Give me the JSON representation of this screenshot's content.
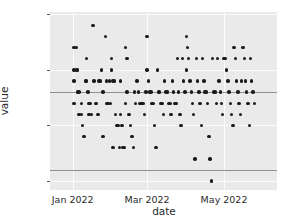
{
  "chart_data": {
    "type": "scatter",
    "title": "",
    "xlabel": "date",
    "ylabel": "value",
    "grid": true,
    "legend": "none",
    "xlim": [
      "2021-12-14",
      "2022-06-12"
    ],
    "ylim": [
      20.42,
      22.02
    ],
    "yticks": [
      22,
      21.5,
      21,
      20.5
    ],
    "ytick_labels": [
      "22",
      "21.5",
      "21",
      "20.5"
    ],
    "xticks": [
      "2022-01-01",
      "2022-03-01",
      "2022-05-01"
    ],
    "xtick_labels": [
      "Jan 2022",
      "Mar 2022",
      "May 2022"
    ],
    "reference_lines": [
      21.3,
      20.6
    ],
    "marker_color": "#1a1a1a",
    "plot_background": "#eaeaea",
    "gridline_color": "#fbfbfb",
    "reference_line_color": "#909090",
    "points": [
      {
        "x": "2022-01-02",
        "y": 21.7
      },
      {
        "x": "2022-01-02",
        "y": 21.5
      },
      {
        "x": "2022-01-02",
        "y": 21.4
      },
      {
        "x": "2022-01-02",
        "y": 21.2
      },
      {
        "x": "2022-01-04",
        "y": 21.7
      },
      {
        "x": "2022-01-04",
        "y": 21.5
      },
      {
        "x": "2022-01-05",
        "y": 21.5
      },
      {
        "x": "2022-01-05",
        "y": 21.3
      },
      {
        "x": "2022-01-06",
        "y": 21.3
      },
      {
        "x": "2022-01-06",
        "y": 21.1
      },
      {
        "x": "2022-01-08",
        "y": 21.2
      },
      {
        "x": "2022-01-08",
        "y": 21.1
      },
      {
        "x": "2022-01-09",
        "y": 21.0
      },
      {
        "x": "2022-01-10",
        "y": 20.9
      },
      {
        "x": "2022-01-11",
        "y": 21.4
      },
      {
        "x": "2022-01-12",
        "y": 21.6
      },
      {
        "x": "2022-01-12",
        "y": 21.4
      },
      {
        "x": "2022-01-13",
        "y": 21.3
      },
      {
        "x": "2022-01-14",
        "y": 21.2
      },
      {
        "x": "2022-01-14",
        "y": 21.1
      },
      {
        "x": "2022-01-15",
        "y": 21.2
      },
      {
        "x": "2022-01-16",
        "y": 21.1
      },
      {
        "x": "2022-01-17",
        "y": 21.9
      },
      {
        "x": "2022-01-18",
        "y": 21.4
      },
      {
        "x": "2022-01-19",
        "y": 21.2
      },
      {
        "x": "2022-01-20",
        "y": 21.2
      },
      {
        "x": "2022-01-21",
        "y": 21.1
      },
      {
        "x": "2022-01-22",
        "y": 21.4
      },
      {
        "x": "2022-01-23",
        "y": 21.4
      },
      {
        "x": "2022-01-24",
        "y": 21.5
      },
      {
        "x": "2022-01-25",
        "y": 21.3
      },
      {
        "x": "2022-01-25",
        "y": 20.9
      },
      {
        "x": "2022-01-27",
        "y": 21.8
      },
      {
        "x": "2022-01-28",
        "y": 21.4
      },
      {
        "x": "2022-01-28",
        "y": 21.2
      },
      {
        "x": "2022-01-29",
        "y": 21.2
      },
      {
        "x": "2022-01-30",
        "y": 21.4
      },
      {
        "x": "2022-01-31",
        "y": 21.2
      },
      {
        "x": "2022-02-01",
        "y": 21.6
      },
      {
        "x": "2022-02-01",
        "y": 21.5
      },
      {
        "x": "2022-02-02",
        "y": 21.4
      },
      {
        "x": "2022-02-02",
        "y": 20.8
      },
      {
        "x": "2022-02-03",
        "y": 21.4
      },
      {
        "x": "2022-02-04",
        "y": 21.1
      },
      {
        "x": "2022-02-05",
        "y": 21.0
      },
      {
        "x": "2022-02-06",
        "y": 21.0
      },
      {
        "x": "2022-02-07",
        "y": 20.8
      },
      {
        "x": "2022-02-08",
        "y": 21.4
      },
      {
        "x": "2022-02-08",
        "y": 21.1
      },
      {
        "x": "2022-02-09",
        "y": 21.0
      },
      {
        "x": "2022-02-10",
        "y": 20.8
      },
      {
        "x": "2022-02-11",
        "y": 20.8
      },
      {
        "x": "2022-02-12",
        "y": 21.7
      },
      {
        "x": "2022-02-12",
        "y": 21.2
      },
      {
        "x": "2022-02-13",
        "y": 21.6
      },
      {
        "x": "2022-02-13",
        "y": 21.3
      },
      {
        "x": "2022-02-14",
        "y": 21.1
      },
      {
        "x": "2022-02-15",
        "y": 21.1
      },
      {
        "x": "2022-02-16",
        "y": 21.0
      },
      {
        "x": "2022-02-17",
        "y": 20.9
      },
      {
        "x": "2022-02-18",
        "y": 20.8
      },
      {
        "x": "2022-02-19",
        "y": 21.3
      },
      {
        "x": "2022-02-20",
        "y": 21.2
      },
      {
        "x": "2022-02-21",
        "y": 21.4
      },
      {
        "x": "2022-02-22",
        "y": 21.3
      },
      {
        "x": "2022-02-23",
        "y": 21.2
      },
      {
        "x": "2022-02-24",
        "y": 21.2
      },
      {
        "x": "2022-02-25",
        "y": 21.2
      },
      {
        "x": "2022-02-26",
        "y": 21.2
      },
      {
        "x": "2022-02-27",
        "y": 21.1
      },
      {
        "x": "2022-02-28",
        "y": 21.3
      },
      {
        "x": "2022-03-01",
        "y": 21.8
      },
      {
        "x": "2022-03-01",
        "y": 21.5
      },
      {
        "x": "2022-03-02",
        "y": 21.4
      },
      {
        "x": "2022-03-03",
        "y": 21.3
      },
      {
        "x": "2022-03-04",
        "y": 21.3
      },
      {
        "x": "2022-03-05",
        "y": 21.2
      },
      {
        "x": "2022-03-06",
        "y": 21.2
      },
      {
        "x": "2022-03-07",
        "y": 21.0
      },
      {
        "x": "2022-03-08",
        "y": 20.8
      },
      {
        "x": "2022-03-09",
        "y": 21.5
      },
      {
        "x": "2022-03-10",
        "y": 21.3
      },
      {
        "x": "2022-03-11",
        "y": 21.3
      },
      {
        "x": "2022-03-12",
        "y": 21.2
      },
      {
        "x": "2022-03-13",
        "y": 21.2
      },
      {
        "x": "2022-03-14",
        "y": 21.1
      },
      {
        "x": "2022-03-15",
        "y": 21.4
      },
      {
        "x": "2022-03-16",
        "y": 21.3
      },
      {
        "x": "2022-03-17",
        "y": 21.3
      },
      {
        "x": "2022-03-18",
        "y": 21.2
      },
      {
        "x": "2022-03-19",
        "y": 21.2
      },
      {
        "x": "2022-03-20",
        "y": 21.1
      },
      {
        "x": "2022-03-21",
        "y": 21.4
      },
      {
        "x": "2022-03-22",
        "y": 21.3
      },
      {
        "x": "2022-03-23",
        "y": 21.2
      },
      {
        "x": "2022-03-24",
        "y": 21.2
      },
      {
        "x": "2022-03-25",
        "y": 21.6
      },
      {
        "x": "2022-03-26",
        "y": 21.3
      },
      {
        "x": "2022-03-27",
        "y": 21.1
      },
      {
        "x": "2022-03-28",
        "y": 21.0
      },
      {
        "x": "2022-03-29",
        "y": 21.6
      },
      {
        "x": "2022-03-30",
        "y": 21.4
      },
      {
        "x": "2022-03-31",
        "y": 21.3
      },
      {
        "x": "2022-04-01",
        "y": 21.8
      },
      {
        "x": "2022-04-01",
        "y": 21.5
      },
      {
        "x": "2022-04-02",
        "y": 21.7
      },
      {
        "x": "2022-04-03",
        "y": 21.6
      },
      {
        "x": "2022-04-04",
        "y": 21.4
      },
      {
        "x": "2022-04-05",
        "y": 21.3
      },
      {
        "x": "2022-04-06",
        "y": 21.2
      },
      {
        "x": "2022-04-07",
        "y": 21.1
      },
      {
        "x": "2022-04-08",
        "y": 20.7
      },
      {
        "x": "2022-04-09",
        "y": 21.6
      },
      {
        "x": "2022-04-10",
        "y": 21.4
      },
      {
        "x": "2022-04-11",
        "y": 21.3
      },
      {
        "x": "2022-04-12",
        "y": 21.2
      },
      {
        "x": "2022-04-13",
        "y": 21.0
      },
      {
        "x": "2022-04-14",
        "y": 21.6
      },
      {
        "x": "2022-04-15",
        "y": 21.4
      },
      {
        "x": "2022-04-16",
        "y": 21.3
      },
      {
        "x": "2022-04-17",
        "y": 21.3
      },
      {
        "x": "2022-04-18",
        "y": 21.2
      },
      {
        "x": "2022-04-19",
        "y": 20.9
      },
      {
        "x": "2022-04-20",
        "y": 20.7
      },
      {
        "x": "2022-04-21",
        "y": 20.5
      },
      {
        "x": "2022-04-22",
        "y": 21.6
      },
      {
        "x": "2022-04-23",
        "y": 21.3
      },
      {
        "x": "2022-04-24",
        "y": 21.3
      },
      {
        "x": "2022-04-25",
        "y": 21.2
      },
      {
        "x": "2022-04-26",
        "y": 21.6
      },
      {
        "x": "2022-04-27",
        "y": 21.4
      },
      {
        "x": "2022-04-28",
        "y": 21.3
      },
      {
        "x": "2022-04-29",
        "y": 21.2
      },
      {
        "x": "2022-04-30",
        "y": 21.1
      },
      {
        "x": "2022-05-01",
        "y": 21.6
      },
      {
        "x": "2022-05-02",
        "y": 21.6
      },
      {
        "x": "2022-05-03",
        "y": 21.5
      },
      {
        "x": "2022-05-04",
        "y": 21.4
      },
      {
        "x": "2022-05-05",
        "y": 21.3
      },
      {
        "x": "2022-05-06",
        "y": 21.2
      },
      {
        "x": "2022-05-07",
        "y": 21.1
      },
      {
        "x": "2022-05-08",
        "y": 21.0
      },
      {
        "x": "2022-05-09",
        "y": 21.7
      },
      {
        "x": "2022-05-10",
        "y": 21.6
      },
      {
        "x": "2022-05-11",
        "y": 21.4
      },
      {
        "x": "2022-05-12",
        "y": 21.3
      },
      {
        "x": "2022-05-13",
        "y": 21.2
      },
      {
        "x": "2022-05-14",
        "y": 21.1
      },
      {
        "x": "2022-05-15",
        "y": 21.4
      },
      {
        "x": "2022-05-16",
        "y": 21.7
      },
      {
        "x": "2022-05-17",
        "y": 21.6
      },
      {
        "x": "2022-05-18",
        "y": 21.4
      },
      {
        "x": "2022-05-19",
        "y": 21.3
      },
      {
        "x": "2022-05-20",
        "y": 21.2
      },
      {
        "x": "2022-05-21",
        "y": 21.0
      },
      {
        "x": "2022-05-22",
        "y": 21.6
      },
      {
        "x": "2022-05-23",
        "y": 21.4
      },
      {
        "x": "2022-05-24",
        "y": 21.3
      },
      {
        "x": "2022-05-25",
        "y": 21.2
      }
    ]
  }
}
